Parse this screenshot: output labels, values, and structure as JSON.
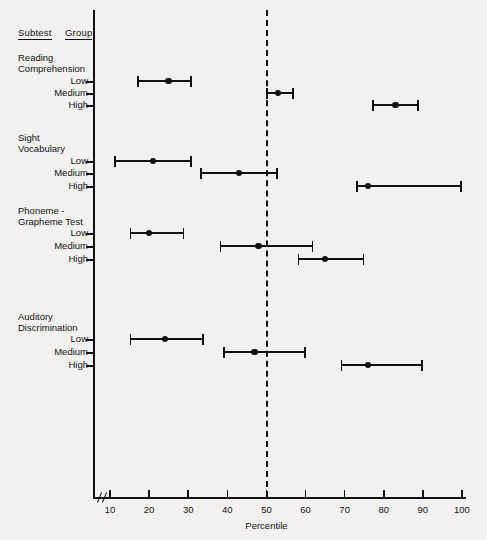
{
  "headers": {
    "subtest": "Subtest",
    "group": "Group"
  },
  "axis": {
    "xlabel": "Percentile",
    "ticks": [
      "10",
      "20",
      "30",
      "40",
      "50",
      "60",
      "70",
      "80",
      "90",
      "100"
    ],
    "reference_line_value": 50,
    "break_mark": true
  },
  "groups": {
    "low": "Low",
    "medium": "Medium",
    "high": "High"
  },
  "subtests": [
    {
      "line1": "Reading",
      "line2": "Comprehension"
    },
    {
      "line1": "Sight",
      "line2": "Vocabulary"
    },
    {
      "line1": "Phoneme -",
      "line2": "Grapheme Test"
    },
    {
      "line1": "Auditory",
      "line2": "Discrimination"
    }
  ],
  "chart_data": {
    "type": "scatter",
    "title": "",
    "xlabel": "Percentile",
    "ylabel": "",
    "xlim": [
      10,
      100
    ],
    "grid": false,
    "legend": "none",
    "reference_line": {
      "value": 50,
      "style": "dashed"
    },
    "axis_break": {
      "after": 10,
      "note": "broken axis between 0 and 10"
    },
    "categories": [
      "Reading Comprehension - Low",
      "Reading Comprehension - Medium",
      "Reading Comprehension - High",
      "Sight Vocabulary - Low",
      "Sight Vocabulary - Medium",
      "Sight Vocabulary - High",
      "Phoneme - Grapheme Test - Low",
      "Phoneme - Grapheme Test - Medium",
      "Phoneme - Grapheme Test - High",
      "Auditory Discrimination - Low",
      "Auditory Discrimination - Medium",
      "Auditory Discrimination - High"
    ],
    "series": [
      {
        "name": "Median percentile with range",
        "points": [
          {
            "subtest": "Reading Comprehension",
            "group": "Low",
            "value": 25,
            "low": 17,
            "high": 31,
            "y": 81
          },
          {
            "subtest": "Reading Comprehension",
            "group": "Medium",
            "value": 53,
            "low": 50,
            "high": 57,
            "y": 93
          },
          {
            "subtest": "Reading Comprehension",
            "group": "High",
            "value": 83,
            "low": 77,
            "high": 89,
            "y": 105
          },
          {
            "subtest": "Sight Vocabulary",
            "group": "Low",
            "value": 21,
            "low": 11,
            "high": 31,
            "y": 161
          },
          {
            "subtest": "Sight Vocabulary",
            "group": "Medium",
            "value": 43,
            "low": 33,
            "high": 53,
            "y": 173
          },
          {
            "subtest": "Sight Vocabulary",
            "group": "High",
            "value": 76,
            "low": 73,
            "high": 100,
            "y": 186
          },
          {
            "subtest": "Phoneme - Grapheme Test",
            "group": "Low",
            "value": 20,
            "low": 15,
            "high": 29,
            "y": 233
          },
          {
            "subtest": "Phoneme - Grapheme Test",
            "group": "Medium",
            "value": 48,
            "low": 38,
            "high": 62,
            "y": 246
          },
          {
            "subtest": "Phoneme - Grapheme Test",
            "group": "High",
            "value": 65,
            "low": 58,
            "high": 75,
            "y": 259
          },
          {
            "subtest": "Auditory Discrimination",
            "group": "Low",
            "value": 24,
            "low": 15,
            "high": 34,
            "y": 339
          },
          {
            "subtest": "Auditory Discrimination",
            "group": "Medium",
            "value": 47,
            "low": 39,
            "high": 60,
            "y": 352
          },
          {
            "subtest": "Auditory Discrimination",
            "group": "High",
            "value": 76,
            "low": 69,
            "high": 90,
            "y": 365
          }
        ]
      }
    ]
  },
  "layout": {
    "axis_x_px": 93,
    "axis_top_px": 10,
    "axis_bottom_px": 497,
    "x0_px": 110,
    "x0_val": 10,
    "px_per_unit": 3.911,
    "label_right_px": 88,
    "subtest_left_px": 18,
    "sections": [
      {
        "l1_y": 52,
        "l2_y": 63
      },
      {
        "l1_y": 132,
        "l2_y": 143
      },
      {
        "l1_y": 205,
        "l2_y": 216
      },
      {
        "l1_y": 311,
        "l2_y": 322
      }
    ]
  }
}
